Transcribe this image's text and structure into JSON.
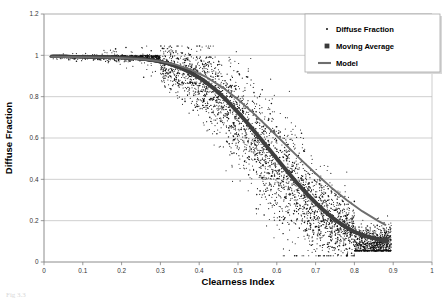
{
  "chart_data": {
    "type": "scatter",
    "title": "",
    "xlabel": "Clearness Index",
    "ylabel": "Diffuse Fraction",
    "xlim": [
      0,
      1
    ],
    "ylim": [
      0,
      1.2
    ],
    "xticks": [
      "0",
      "0.1",
      "0.2",
      "0.3",
      "0.4",
      "0.5",
      "0.6",
      "0.7",
      "0.8",
      "0.9",
      "1"
    ],
    "xtick_values": [
      0,
      0.1,
      0.2,
      0.3,
      0.4,
      0.5,
      0.6,
      0.7,
      0.8,
      0.9,
      1
    ],
    "yticks": [
      "0",
      "0.2",
      "0.4",
      "0.6",
      "0.8",
      "1",
      "1.2"
    ],
    "ytick_values": [
      0,
      0.2,
      0.4,
      0.6,
      0.8,
      1.0,
      1.2
    ],
    "grid": {
      "horizontal": true,
      "vertical": false,
      "color": "#b0b0b0"
    },
    "legend": {
      "position": "top-right",
      "entries": [
        {
          "label": "Diffuse Fraction",
          "marker": "dot",
          "color": "#000000"
        },
        {
          "label": "Moving Average",
          "marker": "square",
          "color": "#3a3a3a"
        },
        {
          "label": "Model",
          "marker": "line",
          "color": "#6e6e6e"
        }
      ]
    },
    "series": [
      {
        "name": "Moving Average",
        "marker": "square",
        "color": "#3f3f3f",
        "x": [
          0.02,
          0.05,
          0.08,
          0.11,
          0.14,
          0.17,
          0.2,
          0.23,
          0.26,
          0.29,
          0.32,
          0.35,
          0.38,
          0.41,
          0.44,
          0.47,
          0.5,
          0.53,
          0.56,
          0.59,
          0.62,
          0.65,
          0.68,
          0.71,
          0.74,
          0.77,
          0.8,
          0.83,
          0.86,
          0.88
        ],
        "values": [
          0.995,
          0.995,
          0.994,
          0.993,
          0.992,
          0.991,
          0.989,
          0.986,
          0.981,
          0.973,
          0.96,
          0.941,
          0.915,
          0.88,
          0.836,
          0.784,
          0.724,
          0.66,
          0.592,
          0.523,
          0.454,
          0.387,
          0.325,
          0.268,
          0.219,
          0.178,
          0.146,
          0.124,
          0.11,
          0.104
        ]
      },
      {
        "name": "Model",
        "marker": "line",
        "color": "#6e6e6e",
        "x": [
          0.02,
          0.06,
          0.1,
          0.14,
          0.18,
          0.22,
          0.26,
          0.3,
          0.34,
          0.38,
          0.42,
          0.46,
          0.5,
          0.54,
          0.58,
          0.62,
          0.66,
          0.7,
          0.74,
          0.78,
          0.82,
          0.86,
          0.88
        ],
        "values": [
          0.993,
          0.992,
          0.991,
          0.99,
          0.988,
          0.985,
          0.98,
          0.971,
          0.955,
          0.93,
          0.893,
          0.845,
          0.786,
          0.719,
          0.647,
          0.573,
          0.499,
          0.428,
          0.361,
          0.3,
          0.246,
          0.2,
          0.18
        ]
      }
    ],
    "scatter_description": {
      "name": "Diffuse Fraction",
      "marker": "dot",
      "color": "#111111",
      "point_count": 4200,
      "plateau_value": 1.0,
      "plateau_until_x": 0.3,
      "knee_x": 0.45,
      "floor_value": 0.09,
      "floor_from_x": 0.8,
      "spread_max": 0.3
    }
  },
  "caption": {
    "text": "Fig 3.3"
  }
}
